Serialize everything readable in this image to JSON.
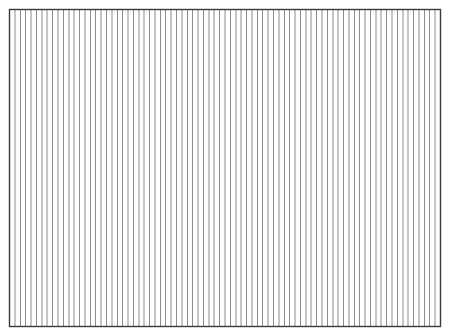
{
  "figure": {
    "width": 449,
    "height": 336,
    "background": "#ffffff",
    "frame": {
      "x": 9.5,
      "y": 9.5,
      "width": 431,
      "height": 317,
      "stroke": "#3a3a3a",
      "stroke_width": 1.4
    },
    "vertical_lines": {
      "count": 79,
      "intervals": 80,
      "stroke": "#8c8c8c",
      "stroke_width": 1
    }
  }
}
